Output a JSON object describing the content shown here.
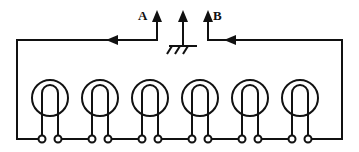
{
  "diagram": {
    "type": "electrical-schematic",
    "canvas": {
      "width": 359,
      "height": 152
    },
    "stroke_color": "#111111",
    "background_color": "#ffffff",
    "labels": [
      {
        "id": "a",
        "text": "A",
        "x": 138,
        "y": 9
      },
      {
        "id": "b",
        "text": "B",
        "x": 213,
        "y": 9
      }
    ],
    "terminals_note": "12 round terminal posts along the bottom rail, paired per lamp",
    "lamp_count": 6,
    "lamps": [
      {
        "index": 1,
        "cx": 50,
        "cy": 98,
        "r": 18
      },
      {
        "index": 2,
        "cx": 100,
        "cy": 98,
        "r": 18
      },
      {
        "index": 3,
        "cx": 150,
        "cy": 98,
        "r": 18
      },
      {
        "index": 4,
        "cx": 200,
        "cy": 98,
        "r": 18
      },
      {
        "index": 5,
        "cx": 250,
        "cy": 98,
        "r": 18
      },
      {
        "index": 6,
        "cx": 300,
        "cy": 98,
        "r": 18
      }
    ],
    "arrows": {
      "vertical": [
        {
          "id": "arrow-a",
          "x": 157,
          "from_y": 40,
          "to_y": 12,
          "direction": "up"
        },
        {
          "id": "arrow-ground",
          "x": 183,
          "from_y": 44,
          "to_y": 12,
          "direction": "up"
        },
        {
          "id": "arrow-b",
          "x": 208,
          "from_y": 40,
          "to_y": 12,
          "direction": "up"
        }
      ],
      "horizontal": [
        {
          "id": "flow-left",
          "y": 40,
          "from_x": 135,
          "to_x": 108,
          "direction": "left"
        },
        {
          "id": "flow-right",
          "y": 40,
          "from_x": 253,
          "to_x": 226,
          "direction": "left"
        }
      ]
    },
    "ground_symbol": {
      "x": 183,
      "y": 46,
      "hatch_count": 3
    }
  }
}
